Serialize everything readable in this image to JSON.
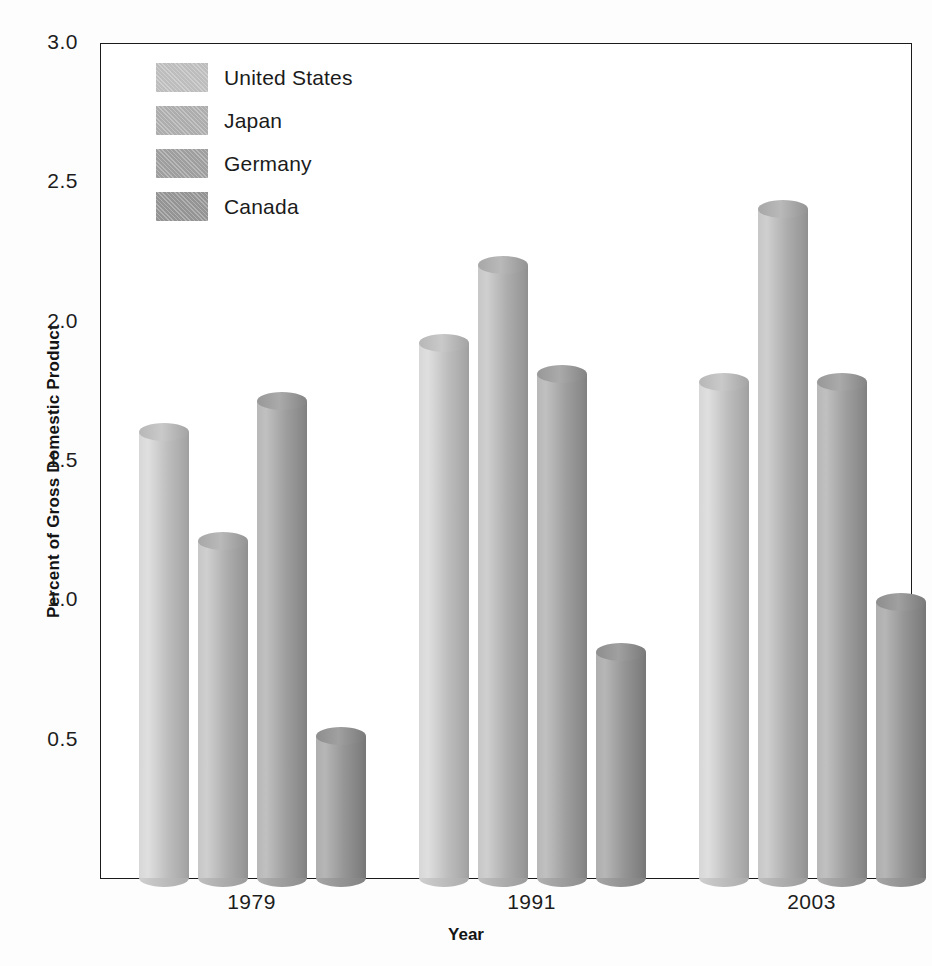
{
  "chart_data": {
    "type": "bar",
    "title": "",
    "xlabel": "Year",
    "ylabel": "Percent of Gross Domestic Product",
    "categories": [
      "1979",
      "1991",
      "2003"
    ],
    "ylim": [
      0,
      3.0
    ],
    "ytick_labels": [
      "0.5",
      "1.0",
      "1.5",
      "2.0",
      "2.5",
      "3.0"
    ],
    "ytick_values": [
      0.5,
      1.0,
      1.5,
      2.0,
      2.5,
      3.0
    ],
    "grid": false,
    "legend_position": "top-left-inside",
    "series": [
      {
        "name": "United States",
        "color": "#bdbdbd",
        "values": [
          1.6,
          1.92,
          1.78
        ]
      },
      {
        "name": "Japan",
        "color": "#adadad",
        "values": [
          1.21,
          2.2,
          2.4
        ]
      },
      {
        "name": "Germany",
        "color": "#9e9e9e",
        "values": [
          1.71,
          1.81,
          1.78
        ]
      },
      {
        "name": "Canada",
        "color": "#949494",
        "values": [
          0.51,
          0.81,
          0.99
        ]
      }
    ]
  },
  "axis": {
    "frame_color": "#1b1b1b"
  }
}
